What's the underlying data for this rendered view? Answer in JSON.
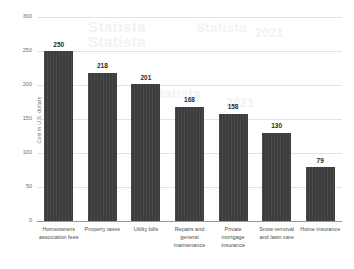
{
  "chart_data": {
    "type": "bar",
    "title": "",
    "subtitle": "",
    "xlabel": "",
    "ylabel": "Cost in U.S. dollars",
    "ylim": [
      0,
      300
    ],
    "y_ticks": [
      0,
      50,
      100,
      150,
      200,
      250,
      300
    ],
    "y_tick_labels": [
      "0",
      "50",
      "100",
      "150",
      "200",
      "250",
      "300"
    ],
    "grid": true,
    "legend": false,
    "legend_position": "none",
    "orientation": "vertical",
    "categories": [
      "Homeowners association fees",
      "Property taxes",
      "Utility bills",
      "Repairs and general maintenance",
      "Private mortgage insurance",
      "Snow removal and lawn care",
      "Home insurance"
    ],
    "values": [
      250,
      218,
      201,
      168,
      158,
      130,
      79
    ],
    "value_labels": [
      "250",
      "218",
      "201",
      "168",
      "158",
      "130",
      "79"
    ],
    "bar_color": "#3f3f3f",
    "grid_color": "#e3e3e3",
    "axis_color": "#9a9a9a",
    "label_color": "#6e6e6e",
    "value_label_color": "#2b2b2b",
    "background_color": "#ffffff"
  },
  "watermark": {
    "lines": [
      "Statista",
      "Statista",
      "Statista",
      "2021",
      "Statista",
      "2021"
    ]
  }
}
